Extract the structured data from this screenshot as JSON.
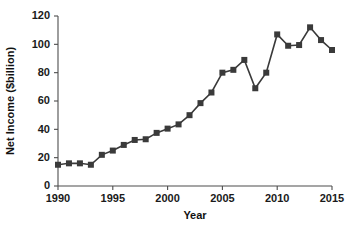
{
  "chart_data": {
    "type": "line",
    "title": "",
    "xlabel": "Year",
    "ylabel": "Net Income ($billion)",
    "xlim": [
      1990,
      2015
    ],
    "ylim": [
      0,
      120
    ],
    "xticks": [
      1990,
      1995,
      2000,
      2005,
      2010,
      2015
    ],
    "yticks": [
      0,
      20,
      40,
      60,
      80,
      100,
      120
    ],
    "grid": false,
    "legend": "none",
    "marker": "square",
    "series_color": "#3a3a3a",
    "x": [
      1990,
      1991,
      1992,
      1993,
      1994,
      1995,
      1996,
      1997,
      1998,
      1999,
      2000,
      2001,
      2002,
      2003,
      2004,
      2005,
      2006,
      2007,
      2008,
      2009,
      2010,
      2011,
      2012,
      2013,
      2014,
      2015
    ],
    "values": [
      15,
      16,
      16,
      15,
      22,
      25,
      29,
      32.5,
      33,
      37.5,
      40.5,
      43.5,
      50,
      58.5,
      66,
      80,
      82,
      89,
      69,
      80,
      107,
      99,
      99.5,
      112,
      103,
      96
    ],
    "series": [
      {
        "name": "Net Income",
        "values": [
          15,
          16,
          16,
          15,
          22,
          25,
          29,
          32.5,
          33,
          37.5,
          40.5,
          43.5,
          50,
          58.5,
          66,
          80,
          82,
          89,
          69,
          80,
          107,
          99,
          99.5,
          112,
          103,
          96
        ]
      }
    ]
  },
  "axis": {
    "y_tick_labels": [
      "0",
      "20",
      "40",
      "60",
      "80",
      "100",
      "120"
    ],
    "x_tick_labels": [
      "1990",
      "1995",
      "2000",
      "2005",
      "2010",
      "2015"
    ],
    "x_title": "Year",
    "y_title": "Net Income ($billion)"
  }
}
